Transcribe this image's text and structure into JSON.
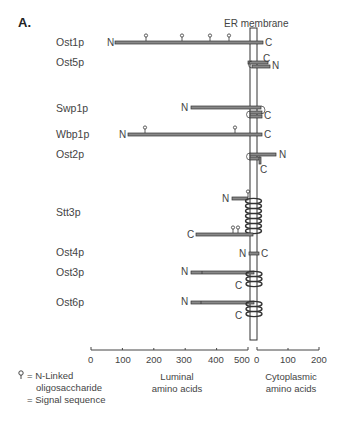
{
  "figure": {
    "panel_label": "A.",
    "membrane_label": "ER membrane",
    "proteins": [
      {
        "name": "Ost1p",
        "n": "N",
        "c": "C"
      },
      {
        "name": "Ost5p",
        "n": "N",
        "c": "C"
      },
      {
        "name": "Swp1p",
        "n": "N",
        "c": "C"
      },
      {
        "name": "Wbp1p",
        "n": "N",
        "c": "C"
      },
      {
        "name": "Ost2p",
        "n": "N",
        "c": "C"
      },
      {
        "name": "Stt3p",
        "n": "N",
        "c": "C"
      },
      {
        "name": "Ost4p",
        "n": "N",
        "c": "C"
      },
      {
        "name": "Ost3p",
        "n": "N",
        "c": "C"
      },
      {
        "name": "Ost6p",
        "n": "N",
        "c": "C"
      }
    ],
    "axis": {
      "luminal_ticks": [
        "0",
        "100",
        "200",
        "300",
        "400",
        "500"
      ],
      "cytoplasmic_ticks": [
        "0",
        "100",
        "200"
      ],
      "luminal_title_1": "Luminal",
      "luminal_title_2": "amino acids",
      "cytoplasmic_title_1": "Cytoplasmic",
      "cytoplasmic_title_2": "amino acids"
    },
    "legend": {
      "glycan_symbol": "⚲",
      "glycan_text_1": "= N-Linked",
      "glycan_text_2": "oligosaccharide",
      "signal_text": "= Signal sequence"
    }
  }
}
